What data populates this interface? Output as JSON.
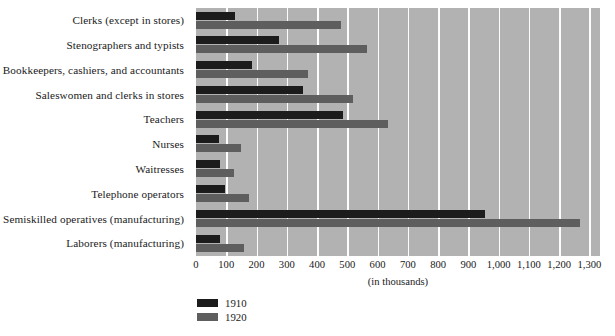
{
  "chart_data": {
    "type": "bar",
    "orientation": "horizontal",
    "title": "",
    "subtitle": "",
    "xlabel": "(in thousands)",
    "ylabel": "",
    "xlim": [
      0,
      1335
    ],
    "xticks": [
      0,
      100,
      200,
      300,
      400,
      500,
      600,
      700,
      800,
      900,
      1000,
      1100,
      1200,
      1300
    ],
    "xticklabels": [
      "0",
      "100",
      "200",
      "300",
      "400",
      "500",
      "600",
      "700",
      "800",
      "900",
      "1,000",
      "1,100",
      "1,200",
      "1,300"
    ],
    "grid": "vertical-only",
    "legend_position": "below-left",
    "plot_background": "#b2b2b2",
    "gridline_color": "#fdfdfd",
    "categories": [
      "Clerks (except in stores)",
      "Stenographers and typists",
      "Bookkeepers, cashiers, and accountants",
      "Saleswomen and clerks in stores",
      "Teachers",
      "Nurses",
      "Waitresses",
      "Telephone operators",
      "Semiskilled operatives (manufacturing)",
      "Laborers (manufacturing)"
    ],
    "series": [
      {
        "name": "1910",
        "color": "#1c1c1c",
        "values": [
          130,
          275,
          185,
          355,
          485,
          75,
          78,
          95,
          955,
          80
        ]
      },
      {
        "name": "1920",
        "color": "#5e5e5e",
        "values": [
          480,
          565,
          370,
          520,
          635,
          150,
          125,
          175,
          1270,
          160
        ]
      }
    ]
  }
}
